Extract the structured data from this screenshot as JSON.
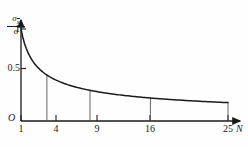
{
  "chart_data": {
    "type": "line",
    "title": "",
    "subtitle": "",
    "xlabel": "N",
    "ylabel": "sigma_xbar / sigma",
    "ylabel_parts": {
      "numerator": "σ",
      "numerator_subscript": "x",
      "numerator_subscript_overbar": true,
      "denominator": "σ"
    },
    "x": [
      1,
      2,
      3,
      4,
      5,
      6,
      7,
      8,
      9,
      10,
      11,
      12,
      13,
      14,
      15,
      16,
      17,
      18,
      19,
      20,
      21,
      22,
      23,
      24,
      25
    ],
    "y": [
      1.0,
      0.707,
      0.577,
      0.5,
      0.447,
      0.408,
      0.378,
      0.354,
      0.333,
      0.316,
      0.302,
      0.289,
      0.277,
      0.267,
      0.258,
      0.25,
      0.243,
      0.236,
      0.229,
      0.224,
      0.218,
      0.213,
      0.209,
      0.204,
      0.2
    ],
    "formula": "1/sqrt(N)",
    "xlim": [
      1,
      25
    ],
    "ylim": [
      0,
      1
    ],
    "xticks": [
      1,
      4,
      9,
      16,
      25
    ],
    "xticklabels": [
      "1",
      "4",
      "9",
      "16",
      "25"
    ],
    "yticks": [
      0.5,
      1
    ],
    "yticklabels": [
      "0.5",
      "1"
    ],
    "origin_label": "O",
    "grid": false,
    "legend": null,
    "droplines": [
      {
        "x": 4,
        "y": 0.5
      },
      {
        "x": 9,
        "y": 0.333
      },
      {
        "x": 16,
        "y": 0.25
      },
      {
        "x": 25,
        "y": 0.2
      }
    ],
    "line_color": "#1a1a1a",
    "axis_color": "#1a1a1a",
    "dropline_color": "#555555",
    "background_color": "#fefefe"
  },
  "axes": {
    "x_labels": [
      {
        "text": "1",
        "x": 21
      },
      {
        "text": "4",
        "x": 56
      },
      {
        "text": "9",
        "x": 97
      },
      {
        "text": "16",
        "x": 150
      },
      {
        "text": "25",
        "x": 228
      }
    ],
    "y_labels": [
      {
        "text": "1",
        "y": 29
      },
      {
        "text": "0.5",
        "y": 68
      }
    ],
    "origin": "O",
    "x_axis_name": "N"
  }
}
